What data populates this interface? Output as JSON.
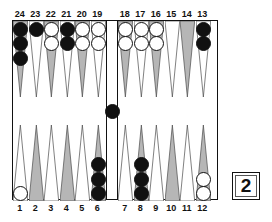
{
  "app": {
    "name": "backgammon-board-diagram"
  },
  "board": {
    "width": 206,
    "height": 180,
    "colors": {
      "point_gray": "#b6b6b6",
      "point_white": "#ffffff",
      "checker_black": "#111111",
      "checker_white": "#ffffff",
      "border": "#111111",
      "background": "#ffffff"
    },
    "top_labels": [
      "24",
      "23",
      "22",
      "21",
      "20",
      "19",
      "18",
      "17",
      "16",
      "15",
      "14",
      "13"
    ],
    "bottom_labels": [
      "1",
      "2",
      "3",
      "4",
      "5",
      "6",
      "7",
      "8",
      "9",
      "10",
      "11",
      "12"
    ],
    "points": [
      {
        "number": "24",
        "row": "top",
        "quadrant": "top-left",
        "slot": 0,
        "shade": "gray",
        "checkers": 3,
        "color": "black"
      },
      {
        "number": "23",
        "row": "top",
        "quadrant": "top-left",
        "slot": 1,
        "shade": "white",
        "checkers": 1,
        "color": "black"
      },
      {
        "number": "22",
        "row": "top",
        "quadrant": "top-left",
        "slot": 2,
        "shade": "gray",
        "checkers": 2,
        "color": "white"
      },
      {
        "number": "21",
        "row": "top",
        "quadrant": "top-left",
        "slot": 3,
        "shade": "white",
        "checkers": 2,
        "color": "black"
      },
      {
        "number": "20",
        "row": "top",
        "quadrant": "top-left",
        "slot": 4,
        "shade": "gray",
        "checkers": 2,
        "color": "white"
      },
      {
        "number": "19",
        "row": "top",
        "quadrant": "top-left",
        "slot": 5,
        "shade": "white",
        "checkers": 2,
        "color": "white"
      },
      {
        "number": "18",
        "row": "top",
        "quadrant": "top-right",
        "slot": 6,
        "shade": "gray",
        "checkers": 2,
        "color": "white"
      },
      {
        "number": "17",
        "row": "top",
        "quadrant": "top-right",
        "slot": 7,
        "shade": "white",
        "checkers": 2,
        "color": "white"
      },
      {
        "number": "16",
        "row": "top",
        "quadrant": "top-right",
        "slot": 8,
        "shade": "gray",
        "checkers": 2,
        "color": "white"
      },
      {
        "number": "15",
        "row": "top",
        "quadrant": "top-right",
        "slot": 9,
        "shade": "white",
        "checkers": 0,
        "color": "none"
      },
      {
        "number": "14",
        "row": "top",
        "quadrant": "top-right",
        "slot": 10,
        "shade": "gray",
        "checkers": 0,
        "color": "none"
      },
      {
        "number": "13",
        "row": "top",
        "quadrant": "top-right",
        "slot": 11,
        "shade": "white",
        "checkers": 2,
        "color": "black"
      },
      {
        "number": "1",
        "row": "bottom",
        "quadrant": "bottom-left",
        "slot": 0,
        "shade": "white",
        "checkers": 1,
        "color": "white"
      },
      {
        "number": "2",
        "row": "bottom",
        "quadrant": "bottom-left",
        "slot": 1,
        "shade": "gray",
        "checkers": 0,
        "color": "none"
      },
      {
        "number": "3",
        "row": "bottom",
        "quadrant": "bottom-left",
        "slot": 2,
        "shade": "white",
        "checkers": 0,
        "color": "none"
      },
      {
        "number": "4",
        "row": "bottom",
        "quadrant": "bottom-left",
        "slot": 3,
        "shade": "gray",
        "checkers": 0,
        "color": "none"
      },
      {
        "number": "5",
        "row": "bottom",
        "quadrant": "bottom-left",
        "slot": 4,
        "shade": "white",
        "checkers": 0,
        "color": "none"
      },
      {
        "number": "6",
        "row": "bottom",
        "quadrant": "bottom-left",
        "slot": 5,
        "shade": "gray",
        "checkers": 3,
        "color": "black"
      },
      {
        "number": "7",
        "row": "bottom",
        "quadrant": "bottom-right",
        "slot": 6,
        "shade": "white",
        "checkers": 0,
        "color": "none"
      },
      {
        "number": "8",
        "row": "bottom",
        "quadrant": "bottom-right",
        "slot": 7,
        "shade": "gray",
        "checkers": 3,
        "color": "black"
      },
      {
        "number": "9",
        "row": "bottom",
        "quadrant": "bottom-right",
        "slot": 8,
        "shade": "white",
        "checkers": 0,
        "color": "none"
      },
      {
        "number": "10",
        "row": "bottom",
        "quadrant": "bottom-right",
        "slot": 9,
        "shade": "gray",
        "checkers": 0,
        "color": "none"
      },
      {
        "number": "11",
        "row": "bottom",
        "quadrant": "bottom-right",
        "slot": 10,
        "shade": "white",
        "checkers": 0,
        "color": "none"
      },
      {
        "number": "12",
        "row": "bottom",
        "quadrant": "bottom-right",
        "slot": 11,
        "shade": "gray",
        "checkers": 2,
        "color": "white"
      }
    ],
    "bar": {
      "black_checkers": 1,
      "white_checkers": 0
    }
  },
  "doubling_cube": {
    "value": "2"
  }
}
